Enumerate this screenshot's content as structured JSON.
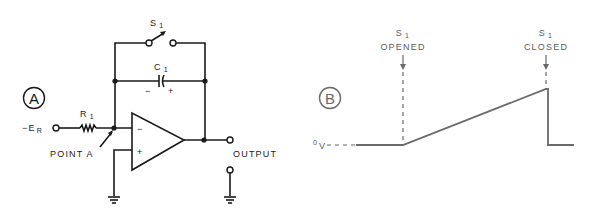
{
  "panel_a": {
    "badge": "A",
    "switch": {
      "label": "S",
      "sub": "1"
    },
    "capacitor": {
      "label": "C",
      "sub": "1",
      "minus": "−",
      "plus": "+"
    },
    "resistor": {
      "label": "R",
      "sub": "1"
    },
    "input": {
      "label": "−E",
      "sub": "R"
    },
    "opamp": {
      "minus": "−",
      "plus": "+"
    },
    "point_a": "POINT A",
    "output": "OUTPUT"
  },
  "panel_b": {
    "badge": "B",
    "zero_label": {
      "label": "0",
      "sub": "V"
    },
    "opened": {
      "line1": "S",
      "sub": "1",
      "line2": "OPENED"
    },
    "closed": {
      "line1": "S",
      "sub": "1",
      "line2": "CLOSED"
    }
  },
  "colors": {
    "ink": "#1a1a1a",
    "trace": "#6a6a6a"
  }
}
